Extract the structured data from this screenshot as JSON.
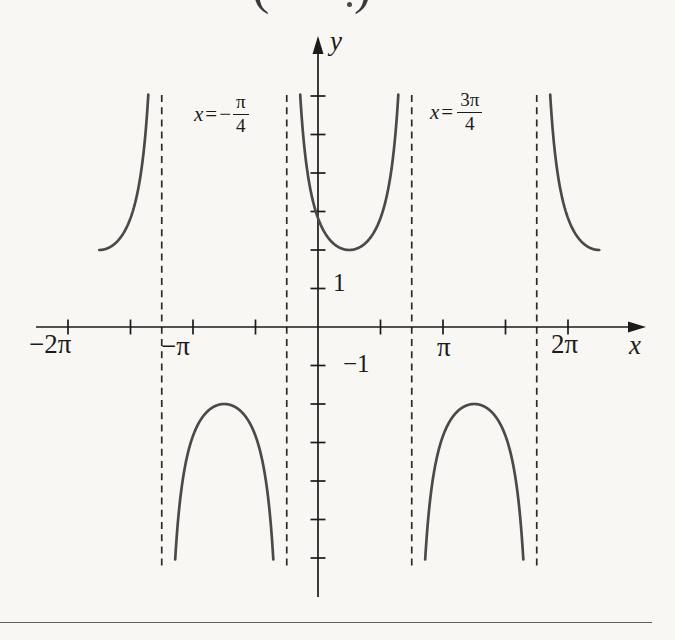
{
  "figure": {
    "top_clipped": {
      "left": "(",
      "right": ")"
    },
    "axis_labels": {
      "x_label": "x",
      "y_label": "y"
    },
    "x_tick_text": {
      "neg_2pi": "−2π",
      "neg_pi": "−π",
      "pos_pi": "π",
      "pos_2pi": "2π"
    },
    "y_tick_text": {
      "pos_one": "1",
      "neg_one": "−1"
    },
    "asymptote_labels": [
      {
        "lhs": "x",
        "rel": "=",
        "sign": "−",
        "num": "π",
        "den": "4"
      },
      {
        "lhs": "x",
        "rel": "=",
        "sign": "",
        "num": "3π",
        "den": "4"
      }
    ]
  },
  "chart_data": {
    "type": "line",
    "function": "y = 2 sec(x − π/4)",
    "amplitude": 2,
    "phase_shift_rad": 0.7853982,
    "period_rad": 6.2831853,
    "vertical_asymptotes": [
      "−5π/4",
      "−π/4",
      "3π/4",
      "7π/4"
    ],
    "vertical_asymptotes_rad": [
      -3.9269908,
      -0.7853982,
      2.3561945,
      5.4977871
    ],
    "branch_domains_rad": [
      [
        -5.4977871,
        -3.9269908
      ],
      [
        -3.9269908,
        -0.7853982
      ],
      [
        -0.7853982,
        2.3561945
      ],
      [
        2.3561945,
        5.4977871
      ],
      [
        5.4977871,
        7.0685835
      ]
    ],
    "extrema": [
      {
        "x": "−7π/4",
        "y": 2
      },
      {
        "x": "−3π/4",
        "y": -2
      },
      {
        "x": "π/4",
        "y": 2
      },
      {
        "x": "5π/4",
        "y": -2
      },
      {
        "x": "9π/4",
        "y": 2
      }
    ],
    "x_ticks_rad": [
      -6.2831853,
      -4.712389,
      -3.1415927,
      -1.5707963,
      1.5707963,
      3.1415927,
      4.712389,
      6.2831853
    ],
    "labeled_x_ticks": [
      {
        "value_rad": -6.2831853,
        "label": "−2π"
      },
      {
        "value_rad": -3.1415927,
        "label": "−π"
      },
      {
        "value_rad": 3.1415927,
        "label": "π"
      },
      {
        "value_rad": 6.2831853,
        "label": "2π"
      }
    ],
    "y_ticks": [
      -6,
      -5,
      -4,
      -3,
      -2,
      -1,
      1,
      2,
      3,
      4,
      5,
      6
    ],
    "labeled_y_ticks": [
      {
        "value": 1,
        "label": "1"
      },
      {
        "value": -1,
        "label": "−1"
      }
    ],
    "xlabel": "x",
    "ylabel": "y",
    "grid": false,
    "legend": false
  }
}
